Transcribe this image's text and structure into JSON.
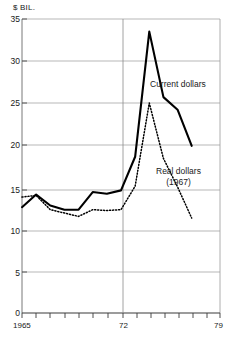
{
  "chart_data": {
    "type": "line",
    "title": "",
    "xlabel": "",
    "ylabel": "$ BIL.",
    "ylim": [
      0,
      35
    ],
    "xlim": [
      1965,
      1979
    ],
    "yticks": [
      0,
      5,
      10,
      15,
      20,
      25,
      30,
      35
    ],
    "ytick_labels": [
      "0",
      "5",
      "10",
      "15",
      "20",
      "25",
      "30",
      "35"
    ],
    "xticks": [
      1965,
      1966,
      1967,
      1968,
      1969,
      1970,
      1971,
      1972,
      1973,
      1974,
      1975,
      1976,
      1977,
      1978,
      1979
    ],
    "xtick_labels": [
      "1965",
      "72",
      "79"
    ],
    "xtick_label_values": [
      1965,
      1972,
      1979
    ],
    "grid": "horizontal-gridlines-and-year-72-vertical-line",
    "legend_position": "inline-annotations",
    "series": [
      {
        "name": "Current dollars",
        "style": "solid",
        "color": "#000000",
        "x": [
          1965,
          1966,
          1967,
          1968,
          1969,
          1970,
          1971,
          1972,
          1973,
          1974,
          1975,
          1976,
          1977
        ],
        "values": [
          12.6,
          14.1,
          12.8,
          12.3,
          12.3,
          14.4,
          14.2,
          14.6,
          18.6,
          33.5,
          25.7,
          24.2,
          19.9
        ]
      },
      {
        "name": "Real dollars (1967)",
        "style": "dotted",
        "color": "#000000",
        "x": [
          1965,
          1966,
          1967,
          1968,
          1969,
          1970,
          1971,
          1972,
          1973,
          1974,
          1975,
          1976,
          1977
        ],
        "values": [
          13.8,
          14.0,
          12.3,
          11.9,
          11.5,
          12.3,
          12.2,
          12.3,
          15.1,
          25.0,
          18.4,
          15.0,
          11.3
        ]
      }
    ],
    "annotations": [
      {
        "text": "Current dollars",
        "series": "Current dollars"
      },
      {
        "text": "Real dollars",
        "series": "Real dollars (1967)"
      },
      {
        "text": "(1967)",
        "series": "Real dollars (1967)"
      }
    ]
  },
  "axis": {
    "unit_label": "$ BIL."
  },
  "labels": {
    "current_dollars": "Current dollars",
    "real_dollars": "Real dollars",
    "real_dollars_base": "(1967)"
  },
  "xaxis": {
    "start": "1965",
    "middle": "72",
    "end": "79"
  },
  "colors": {
    "line": "#000000",
    "grid": "#8c8c8c",
    "axis": "#555555",
    "text": "#1a1a1a",
    "background": "#ffffff"
  }
}
